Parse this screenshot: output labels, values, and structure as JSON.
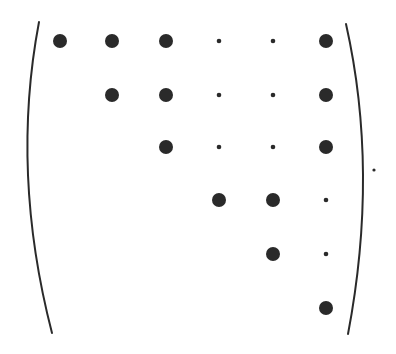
{
  "diagram": {
    "type": "matrix-sparsity-pattern",
    "rows": 6,
    "cols": 6,
    "legend": {
      "large": "significant entry",
      "small": "small entry",
      "empty": "zero entry"
    },
    "pattern": [
      [
        "large",
        "large",
        "large",
        "small",
        "small",
        "large"
      ],
      [
        "empty",
        "large",
        "large",
        "small",
        "small",
        "large"
      ],
      [
        "empty",
        "empty",
        "large",
        "small",
        "small",
        "large"
      ],
      [
        "empty",
        "empty",
        "empty",
        "large",
        "large",
        "small"
      ],
      [
        "empty",
        "empty",
        "empty",
        "empty",
        "large",
        "small"
      ],
      [
        "empty",
        "empty",
        "empty",
        "empty",
        "empty",
        "large"
      ]
    ],
    "col_x": [
      60,
      112,
      166,
      219,
      273,
      326
    ],
    "row_y": [
      41,
      95,
      147,
      200,
      254,
      308
    ],
    "dot_radius": {
      "large": 7,
      "small": 2.3
    },
    "trailing_period": {
      "x": 374,
      "y": 170
    },
    "colors": {
      "ink": "#2a2a2a",
      "background": "#ffffff"
    },
    "brackets": {
      "left": {
        "top": [
          39,
          22
        ],
        "mid": [
          28,
          175
        ],
        "bottom": [
          52,
          333
        ]
      },
      "right": {
        "top": [
          346,
          24
        ],
        "mid": [
          363,
          175
        ],
        "bottom": [
          348,
          334
        ]
      }
    }
  }
}
